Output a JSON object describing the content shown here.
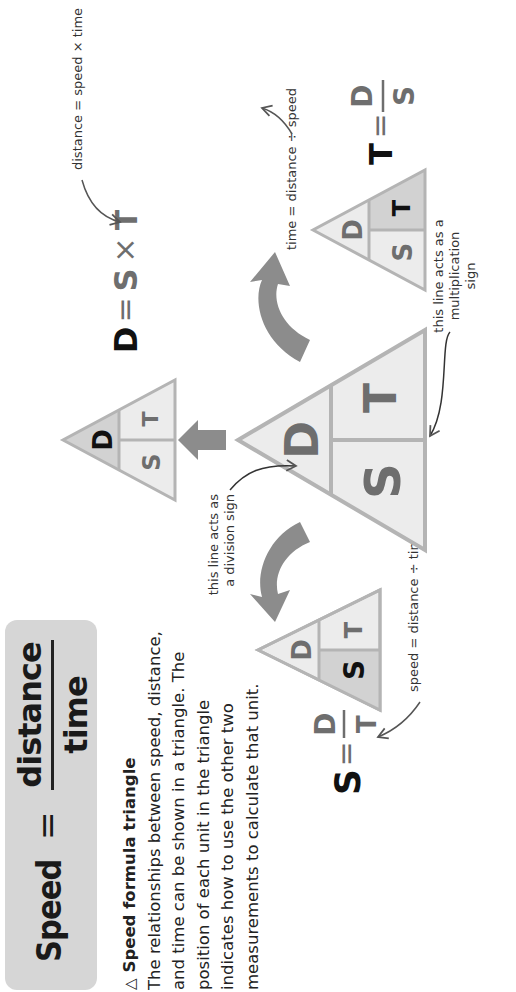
{
  "formula_box": {
    "lhs": "Speed",
    "equals": "=",
    "numerator": "distance",
    "denominator": "time"
  },
  "description": {
    "heading_icon": "△",
    "heading": "Speed formula triangle",
    "body": "The relationships between speed, distance, and time can be shown in a triangle. The position of each unit in the triangle indicates how to use the other two measurements to calculate that unit."
  },
  "triangles": {
    "central": {
      "top": "D",
      "bottom_left": "S",
      "bottom_right": "T"
    },
    "speed": {
      "top": "D",
      "bottom_left": "S",
      "bottom_right": "T",
      "highlight": "S"
    },
    "distance": {
      "top": "D",
      "bottom_left": "S",
      "bottom_right": "T",
      "highlight": "D"
    },
    "time": {
      "top": "D",
      "bottom_left": "S",
      "bottom_right": "T",
      "highlight": "T"
    }
  },
  "annotations": {
    "division_line_1": "this line acts as",
    "division_line_2": "a division sign",
    "multiplication_line_1": "this line acts as a",
    "multiplication_line_2": "multiplication",
    "multiplication_line_3": "sign",
    "speed_rule": "speed = distance ÷ time",
    "distance_rule": "distance = speed × time",
    "time_rule": "time = distance ÷ speed"
  },
  "formulas": {
    "speed": {
      "lhs": "S",
      "eq": "=",
      "num": "D",
      "den": "T"
    },
    "distance": {
      "lhs": "D",
      "eq": "=",
      "rhs_a": "S",
      "op": "×",
      "rhs_b": "T"
    },
    "time": {
      "lhs": "T",
      "eq": "=",
      "num": "D",
      "den": "S"
    }
  },
  "colors": {
    "triangle_fill": "#ececec",
    "triangle_highlight": "#d2d2d2",
    "triangle_stroke": "#b4b4b4",
    "arrow_fill": "#8c8c8c",
    "letter_gray": "#6e6e6e",
    "letter_dark": "#111111",
    "box_fill": "#d6d6d6"
  }
}
